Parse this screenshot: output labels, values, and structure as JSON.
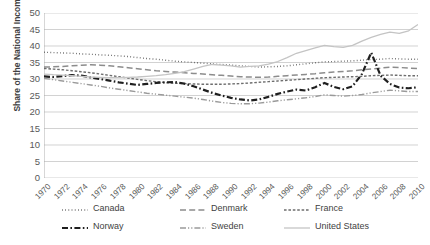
{
  "chart_data": {
    "type": "line",
    "title": "",
    "xlabel": "",
    "ylabel": "Share of the National Income",
    "ylim": [
      0,
      50
    ],
    "ytick_step": 5,
    "grid": true,
    "legend_position": "bottom",
    "x": [
      1970,
      1971,
      1972,
      1973,
      1974,
      1975,
      1976,
      1977,
      1978,
      1979,
      1980,
      1981,
      1982,
      1983,
      1984,
      1985,
      1986,
      1987,
      1988,
      1989,
      1990,
      1991,
      1992,
      1993,
      1994,
      1995,
      1996,
      1997,
      1998,
      1999,
      2000,
      2001,
      2002,
      2003,
      2004,
      2005,
      2006,
      2007,
      2008,
      2009,
      2010
    ],
    "ytick_labels": [
      "0",
      "5",
      "10",
      "15",
      "20",
      "25",
      "30",
      "35",
      "40",
      "45",
      "50"
    ],
    "xtick_labels": [
      "1970",
      "1972",
      "1974",
      "1976",
      "1978",
      "1980",
      "1982",
      "1984",
      "1986",
      "1988",
      "1990",
      "1992",
      "1994",
      "1996",
      "1998",
      "2000",
      "2002",
      "2004",
      "2006",
      "2008",
      "2010"
    ],
    "series": [
      {
        "name": "Canada",
        "style": "dotted",
        "color": "#5a5a5a",
        "width": 1.4,
        "values": [
          38.1,
          38.0,
          37.9,
          37.8,
          37.6,
          37.5,
          37.3,
          37.2,
          37.0,
          36.8,
          36.5,
          36.2,
          36.0,
          35.7,
          35.4,
          35.2,
          35.0,
          34.8,
          34.6,
          34.4,
          34.2,
          34.0,
          33.8,
          33.6,
          33.7,
          33.8,
          34.0,
          34.3,
          34.6,
          34.9,
          35.2,
          35.3,
          35.4,
          35.5,
          35.7,
          35.9,
          36.0,
          36.2,
          36.1,
          36.0,
          36.0
        ]
      },
      {
        "name": "Denmark",
        "style": "dashed-long",
        "color": "#8c8c8c",
        "width": 1.5,
        "values": [
          33.6,
          33.7,
          33.8,
          34.0,
          34.2,
          34.3,
          34.2,
          34.0,
          33.7,
          33.4,
          33.1,
          32.8,
          32.5,
          32.3,
          32.1,
          31.9,
          31.7,
          31.5,
          31.3,
          31.1,
          30.9,
          30.7,
          30.6,
          30.5,
          30.6,
          30.8,
          31.0,
          31.2,
          31.4,
          31.6,
          31.9,
          32.1,
          32.3,
          32.5,
          32.8,
          33.0,
          33.3,
          33.6,
          33.5,
          33.3,
          33.2
        ]
      },
      {
        "name": "France",
        "style": "dashed-short",
        "color": "#6e6e6e",
        "width": 1.4,
        "values": [
          33.2,
          33.0,
          32.8,
          32.5,
          32.2,
          31.9,
          31.5,
          31.1,
          30.7,
          30.3,
          29.9,
          29.5,
          29.2,
          28.9,
          28.7,
          28.6,
          28.5,
          28.4,
          28.4,
          28.4,
          28.5,
          28.6,
          28.8,
          29.0,
          29.2,
          29.4,
          29.6,
          29.8,
          30.0,
          30.2,
          30.4,
          30.5,
          30.6,
          30.7,
          30.8,
          31.0,
          31.1,
          31.2,
          31.1,
          31.0,
          31.0
        ]
      },
      {
        "name": "Norway",
        "style": "dash-dot",
        "color": "#1f1f1f",
        "width": 2.2,
        "values": [
          30.8,
          30.6,
          30.9,
          31.2,
          31.0,
          30.5,
          30.0,
          29.5,
          29.0,
          28.6,
          28.2,
          28.5,
          28.8,
          29.0,
          29.1,
          28.6,
          27.8,
          26.8,
          25.8,
          25.0,
          24.3,
          23.8,
          23.5,
          23.8,
          24.6,
          25.5,
          26.2,
          26.8,
          26.5,
          27.5,
          28.8,
          27.6,
          26.9,
          27.8,
          31.5,
          38.0,
          31.0,
          28.5,
          27.4,
          27.2,
          27.5
        ]
      },
      {
        "name": "Sweden",
        "style": "dash-dot-dot",
        "color": "#9a9a9a",
        "width": 1.4,
        "values": [
          30.2,
          29.8,
          29.4,
          29.0,
          28.6,
          28.2,
          27.8,
          27.3,
          26.9,
          26.5,
          26.1,
          25.7,
          25.4,
          25.1,
          24.8,
          24.5,
          24.2,
          23.8,
          23.3,
          22.9,
          22.6,
          22.5,
          22.5,
          22.7,
          23.0,
          23.4,
          23.7,
          24.0,
          24.3,
          24.7,
          25.2,
          25.0,
          24.8,
          25.0,
          25.3,
          25.8,
          26.2,
          26.6,
          26.4,
          26.2,
          26.2
        ]
      },
      {
        "name": "United States",
        "style": "solid",
        "color": "#c4c4c4",
        "width": 1.3,
        "values": [
          31.5,
          31.3,
          31.2,
          31.0,
          30.8,
          30.6,
          30.5,
          30.4,
          30.4,
          30.5,
          30.6,
          30.8,
          31.0,
          31.3,
          31.7,
          32.2,
          33.0,
          33.8,
          34.4,
          34.2,
          34.0,
          33.6,
          33.8,
          34.0,
          34.5,
          35.3,
          36.5,
          37.8,
          38.6,
          39.4,
          40.2,
          39.8,
          39.6,
          40.2,
          41.5,
          42.6,
          43.5,
          44.2,
          43.8,
          44.6,
          46.5
        ]
      }
    ]
  },
  "legend": {
    "items": [
      {
        "label": "Canada"
      },
      {
        "label": "Denmark"
      },
      {
        "label": "France"
      },
      {
        "label": "Norway"
      },
      {
        "label": "Sweden"
      },
      {
        "label": "United States"
      }
    ]
  }
}
